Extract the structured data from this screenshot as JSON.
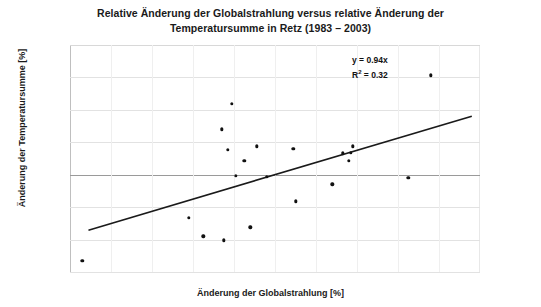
{
  "chart_data": {
    "type": "scatter",
    "title_lines": [
      "Relative Änderung der Globalstrahlung versus relative Änderung der",
      "Temperatursumme in Retz (1983 – 2003)"
    ],
    "xlabel": "Änderung der Globalstrahlung [%]",
    "ylabel": "Änderung der Temperatursumme [%]",
    "xlim": [
      -10,
      10
    ],
    "ylim": [
      -15,
      20
    ],
    "xticks": [
      "-10.0",
      "-8.0",
      "-6.0",
      "-4.0",
      "-2.0",
      "0.0",
      "2.0",
      "4.0",
      "6.0",
      "8.0",
      "10.0"
    ],
    "xtick_values": [
      -10,
      -8,
      -6,
      -4,
      -2,
      0,
      2,
      4,
      6,
      8,
      10
    ],
    "yticks": [
      "20",
      "15",
      "10",
      "5",
      "0",
      "-5",
      "-10",
      "-15"
    ],
    "ytick_values": [
      20,
      15,
      10,
      5,
      0,
      -5,
      -10,
      -15
    ],
    "grid": "horizontal",
    "legend": "none",
    "annotations": {
      "equation": "y = 0.94x",
      "r_squared_prefix": "R",
      "r_squared_exponent": "2",
      "r_squared_value": " = 0.32"
    },
    "series": [
      {
        "name": "Retz 1983–2003",
        "marker": "dot",
        "color": "#111111",
        "points": [
          {
            "x": -9.4,
            "y": -13.3
          },
          {
            "x": -4.2,
            "y": -6.6
          },
          {
            "x": -3.5,
            "y": -9.5
          },
          {
            "x": -2.5,
            "y": -10.1
          },
          {
            "x": -2.1,
            "y": 10.9
          },
          {
            "x": -2.6,
            "y": 7.0
          },
          {
            "x": -2.3,
            "y": 3.8
          },
          {
            "x": -1.5,
            "y": 2.1
          },
          {
            "x": -1.9,
            "y": -0.2
          },
          {
            "x": -1.2,
            "y": -8.1
          },
          {
            "x": -0.9,
            "y": 4.4
          },
          {
            "x": -0.4,
            "y": -0.3
          },
          {
            "x": 0.9,
            "y": 4.0
          },
          {
            "x": 1.0,
            "y": -4.1
          },
          {
            "x": 2.8,
            "y": -1.5
          },
          {
            "x": 3.3,
            "y": 3.3
          },
          {
            "x": 3.7,
            "y": 3.4
          },
          {
            "x": 3.6,
            "y": 2.1
          },
          {
            "x": 3.8,
            "y": 4.4
          },
          {
            "x": 6.5,
            "y": -0.5
          },
          {
            "x": 7.6,
            "y": 15.3
          }
        ]
      }
    ],
    "trendline": {
      "slope": 0.94,
      "intercept": 0.0,
      "x_start": -9.1,
      "x_end": 9.6,
      "color": "#1a1a1a"
    }
  }
}
